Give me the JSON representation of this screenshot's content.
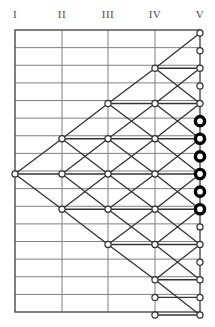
{
  "figure": {
    "kind": "trellis-lattice-diagram",
    "width": 215,
    "height": 327,
    "background_color": "#ffffff"
  },
  "columns": {
    "labels": [
      "I",
      "II",
      "III",
      "IV",
      "V"
    ],
    "x_positions": [
      15,
      62,
      108,
      155,
      200
    ],
    "header_y": 14,
    "node_counts": [
      1,
      3,
      5,
      9,
      17
    ]
  },
  "grid": {
    "left": 15,
    "right": 200,
    "top": 30,
    "bottom": 312,
    "row_count": 16,
    "row_height": 17.625,
    "line_color": "#808080",
    "border_color": "#4a4a4a",
    "line_width": 1,
    "border_width": 1.4
  },
  "nodes": {
    "radius_normal": 3.1,
    "radius_bold": 4.6,
    "fill_color": "#ffffff",
    "stroke_color": "#333333",
    "stroke_width_normal": 1.2,
    "bold_fill_color": "#ffffff",
    "bold_stroke_color": "#000000",
    "stroke_width_bold": 3.4,
    "y_start": 33,
    "y_spacing": 17.625,
    "columns": [
      {
        "label": "I",
        "x": 15,
        "rows": [
          8
        ]
      },
      {
        "label": "II",
        "x": 62,
        "rows": [
          6,
          8,
          10
        ]
      },
      {
        "label": "III",
        "x": 108,
        "rows": [
          4,
          6,
          8,
          10,
          12
        ]
      },
      {
        "label": "IV",
        "x": 155,
        "rows": [
          2,
          4,
          6,
          8,
          10,
          12,
          14,
          15,
          16
        ]
      },
      {
        "label": "V",
        "x": 200,
        "rows": [
          0,
          1,
          2,
          3,
          4,
          5,
          6,
          7,
          8,
          9,
          10,
          11,
          12,
          13,
          14,
          15,
          16
        ]
      }
    ],
    "highlighted": {
      "column": "V",
      "rows": [
        5,
        6,
        7,
        8,
        9,
        10
      ],
      "count": 6,
      "description": "bold filled terminal states"
    }
  },
  "edges": {
    "color": "#333333",
    "width": 1.3,
    "stages": [
      {
        "from": "I",
        "to": "II",
        "pairs": [
          [
            8,
            6
          ],
          [
            8,
            8
          ],
          [
            8,
            10
          ]
        ]
      },
      {
        "from": "II",
        "to": "III",
        "pairs": [
          [
            6,
            4
          ],
          [
            6,
            6
          ],
          [
            6,
            8
          ],
          [
            8,
            6
          ],
          [
            8,
            8
          ],
          [
            8,
            10
          ],
          [
            10,
            8
          ],
          [
            10,
            10
          ],
          [
            10,
            12
          ]
        ]
      },
      {
        "from": "III",
        "to": "IV",
        "pairs": [
          [
            4,
            2
          ],
          [
            4,
            4
          ],
          [
            4,
            6
          ],
          [
            6,
            4
          ],
          [
            6,
            6
          ],
          [
            6,
            8
          ],
          [
            8,
            6
          ],
          [
            8,
            8
          ],
          [
            8,
            10
          ],
          [
            10,
            8
          ],
          [
            10,
            10
          ],
          [
            10,
            12
          ],
          [
            12,
            10
          ],
          [
            12,
            12
          ],
          [
            12,
            14
          ]
        ]
      },
      {
        "from": "IV",
        "to": "V",
        "pairs": [
          [
            2,
            0
          ],
          [
            2,
            2
          ],
          [
            2,
            4
          ],
          [
            4,
            2
          ],
          [
            4,
            4
          ],
          [
            4,
            6
          ],
          [
            6,
            4
          ],
          [
            6,
            6
          ],
          [
            6,
            8
          ],
          [
            8,
            6
          ],
          [
            8,
            8
          ],
          [
            8,
            10
          ],
          [
            10,
            8
          ],
          [
            10,
            10
          ],
          [
            10,
            12
          ],
          [
            12,
            10
          ],
          [
            12,
            12
          ],
          [
            12,
            14
          ],
          [
            14,
            12
          ],
          [
            14,
            14
          ],
          [
            14,
            16
          ],
          [
            15,
            15
          ],
          [
            16,
            16
          ]
        ]
      }
    ]
  }
}
